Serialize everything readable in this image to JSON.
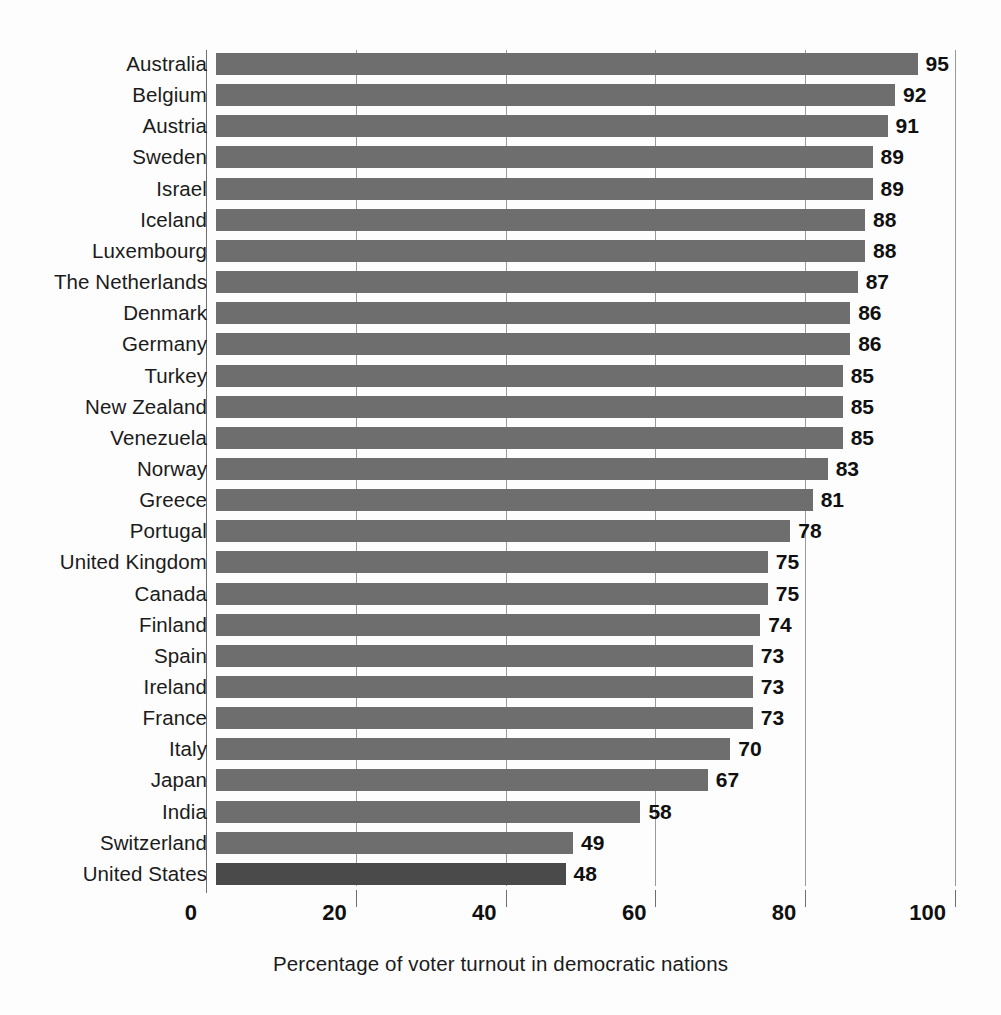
{
  "chart_data": {
    "type": "bar",
    "orientation": "horizontal",
    "title": "",
    "xlabel": "Percentage of voter turnout in democratic nations",
    "ylabel": "",
    "xlim": [
      0,
      100
    ],
    "xticks": [
      0,
      20,
      40,
      60,
      80,
      100
    ],
    "xtick_labels": [
      "0",
      "20",
      "40",
      "60",
      "80",
      "100"
    ],
    "grid": true,
    "legend": null,
    "categories": [
      "Australia",
      "Belgium",
      "Austria",
      "Sweden",
      "Israel",
      "Iceland",
      "Luxembourg",
      "The Netherlands",
      "Denmark",
      "Germany",
      "Turkey",
      "New Zealand",
      "Venezuela",
      "Norway",
      "Greece",
      "Portugal",
      "United Kingdom",
      "Canada",
      "Finland",
      "Spain",
      "Ireland",
      "France",
      "Italy",
      "Japan",
      "India",
      "Switzerland",
      "United States"
    ],
    "values": [
      95,
      92,
      91,
      89,
      89,
      88,
      88,
      87,
      86,
      86,
      85,
      85,
      85,
      83,
      81,
      78,
      75,
      75,
      74,
      73,
      73,
      73,
      70,
      67,
      58,
      49,
      48
    ],
    "value_labels": [
      "95",
      "92",
      "91",
      "89",
      "89",
      "88",
      "88",
      "87",
      "86",
      "86",
      "85",
      "85",
      "85",
      "83",
      "81",
      "78",
      "75",
      "75",
      "74",
      "73",
      "73",
      "73",
      "70",
      "67",
      "58",
      "49",
      "48"
    ],
    "highlighted_category": "United States",
    "colors": {
      "bar": "#6e6e6e",
      "bar_highlight": "#4a4a4a",
      "gridline": "#9a9a9a",
      "axis": "#6f6f6f",
      "text": "#1b1b1b",
      "background": "#fdfdfd"
    }
  }
}
